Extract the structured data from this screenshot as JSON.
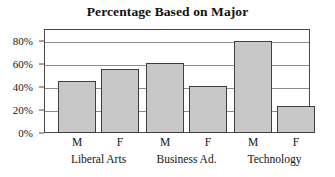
{
  "chart_data": {
    "type": "bar",
    "title": "Percentage Based on Major",
    "xlabel": "",
    "ylabel": "",
    "ylim": [
      0,
      90
    ],
    "ytick_values": [
      0,
      20,
      40,
      60,
      80
    ],
    "ytick_labels": [
      "0%",
      "20%",
      "40%",
      "60%",
      "80%"
    ],
    "grid": true,
    "legend": "none",
    "groups": [
      "Liberal Arts",
      "Business Ad.",
      "Technology"
    ],
    "series_labels": [
      "M",
      "F",
      "M",
      "F",
      "M",
      "F"
    ],
    "categories": [
      "Liberal Arts M",
      "Liberal Arts F",
      "Business Ad. M",
      "Business Ad. F",
      "Technology M",
      "Technology F"
    ],
    "values": [
      45,
      55,
      61,
      41,
      80,
      23
    ],
    "bar_color": "#c8c8c8",
    "bar_edge_color": "#3f3f3f",
    "frame_color": "#4a4a4a",
    "gridline_color": "#8d8d8d",
    "background": "#ffffff"
  }
}
